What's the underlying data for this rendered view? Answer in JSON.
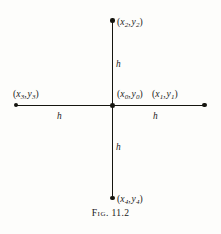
{
  "figure": {
    "caption_prefix": "Fig.",
    "caption_number": "11.2",
    "caption_full": "Fig. 11.2"
  },
  "diagram": {
    "type": "finite-difference-stencil",
    "ink_color": "#15150f",
    "background_color": "#fdfdfb",
    "nodes": [
      {
        "id": "center",
        "label_x": "x",
        "label_x_sub": "0",
        "label_y": "y",
        "label_y_sub": "0",
        "label_text": "(x0, y0)",
        "position": "center"
      },
      {
        "id": "east",
        "label_x": "x",
        "label_x_sub": "1",
        "label_y": "y",
        "label_y_sub": "1",
        "label_text": "(x1, y1)",
        "position": "right"
      },
      {
        "id": "north",
        "label_x": "x",
        "label_x_sub": "2",
        "label_y": "y",
        "label_y_sub": "2",
        "label_text": "(x2, y2)",
        "position": "top"
      },
      {
        "id": "west",
        "label_x": "x",
        "label_x_sub": "3",
        "label_y": "y",
        "label_y_sub": "3",
        "label_text": "(x3, y3)",
        "position": "left"
      },
      {
        "id": "south",
        "label_x": "x",
        "label_x_sub": "4",
        "label_y": "y",
        "label_y_sub": "4",
        "label_text": "(x4, y4)",
        "position": "bottom"
      }
    ],
    "spacings": [
      {
        "id": "north",
        "label": "h"
      },
      {
        "id": "south",
        "label": "h"
      },
      {
        "id": "west",
        "label": "h"
      },
      {
        "id": "east",
        "label": "h"
      }
    ],
    "punctuation": {
      "open_paren": "(",
      "close_paren": ")",
      "comma": ","
    }
  }
}
